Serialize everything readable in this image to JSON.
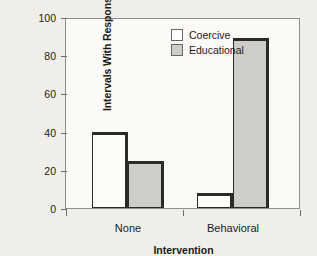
{
  "chart_data": {
    "type": "bar",
    "title": "",
    "xlabel": "Intervention",
    "ylabel": "Intervals With Responses (%)",
    "categories": [
      "None",
      "Behavioral"
    ],
    "series": [
      {
        "name": "Coercive",
        "values": [
          40,
          8
        ],
        "color": "#ffffff"
      },
      {
        "name": "Educational",
        "values": [
          25,
          90
        ],
        "color": "#cfcdc7"
      }
    ],
    "ylim": [
      0,
      100
    ],
    "yticks": [
      0,
      20,
      40,
      60,
      80,
      100
    ],
    "ytick_labels": [
      "0",
      "20",
      "40",
      "60",
      "80",
      "100"
    ],
    "grid": false,
    "legend_position": "top-center-inside",
    "bar_outline_color": "#2b2a28",
    "axis_color": "#8d8d8a",
    "background_color": "#efeee9",
    "plot_background_color": "#fbfaf6"
  },
  "legend": {
    "entries": [
      {
        "label": "Coercive"
      },
      {
        "label": "Educational"
      }
    ]
  }
}
